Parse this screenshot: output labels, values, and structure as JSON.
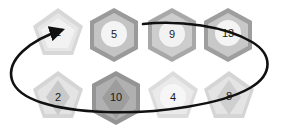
{
  "figure": {
    "title": "",
    "background_color": "#ffffff",
    "stroke_color": "#111111",
    "rows": [
      {
        "name": "top-row",
        "nodes": [
          {
            "label": "1",
            "shape": "pentagon",
            "cx": 58,
            "cy": 35,
            "r": 27,
            "outer_color": "#d8d8d8",
            "mid_color": "#e6e6e6",
            "inner_shape": "pentagon",
            "inner_color": "#f2f2f2"
          },
          {
            "label": "5",
            "shape": "hexagon",
            "cx": 114,
            "cy": 35,
            "r": 27,
            "outer_color": "#9a9a9a",
            "mid_color": "#c4c4c4",
            "inner_shape": "circle",
            "inner_color": "#f4f4f4"
          },
          {
            "label": "9",
            "shape": "hexagon",
            "cx": 172,
            "cy": 35,
            "r": 27,
            "outer_color": "#a8a8a8",
            "mid_color": "#cdcdcd",
            "inner_shape": "circle",
            "inner_color": "#f2f2f2"
          },
          {
            "label": "13",
            "shape": "hexagon",
            "cx": 228,
            "cy": 35,
            "r": 27,
            "outer_color": "#9e9e9e",
            "mid_color": "#c8c8c8",
            "inner_shape": "circle",
            "inner_color": "#f4f4f4"
          }
        ]
      },
      {
        "name": "bottom-row",
        "nodes": [
          {
            "label": "2",
            "shape": "pentagon",
            "cx": 58,
            "cy": 98,
            "r": 27,
            "outer_color": "#d5d5d5",
            "mid_color": "#e4e4e4",
            "inner_shape": "diamond",
            "inner_color": "#c9c9c9"
          },
          {
            "label": "10",
            "shape": "hexagon",
            "cx": 116,
            "cy": 98,
            "r": 27,
            "outer_color": "#949494",
            "mid_color": "#b0b0b0",
            "inner_shape": "diamond",
            "inner_color": "#9d9d9d"
          },
          {
            "label": "4",
            "shape": "pentagon",
            "cx": 173,
            "cy": 98,
            "r": 27,
            "outer_color": "#dcdcdc",
            "mid_color": "#eaeaea",
            "inner_shape": "circle",
            "inner_color": "#f6f6f6"
          },
          {
            "label": "8",
            "shape": "pentagon",
            "cx": 229,
            "cy": 98,
            "r": 27,
            "outer_color": "#d5d5d5",
            "mid_color": "#e4e4e4",
            "inner_shape": "diamond",
            "inner_color": "#cfcfcf"
          }
        ]
      }
    ],
    "loop": {
      "name": "traversal-loop",
      "stroke_color": "#111111",
      "stroke_width": 2.6,
      "has_arrowhead": true,
      "arrow_direction": "right"
    }
  }
}
